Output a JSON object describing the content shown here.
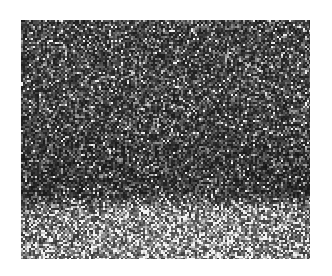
{
  "image": {
    "kind": "speckle-noise-texture",
    "colormap": "grayscale",
    "background_color": "#ffffff",
    "region": {
      "left": 21,
      "top": 20,
      "width": 289,
      "height": 239
    },
    "gradient": {
      "description": "darker upper portion with a dark band near y~70% of height; lighter, higher-contrast speckle at the bottom",
      "stops": [
        {
          "pos": 0.0,
          "mean": 0.3
        },
        {
          "pos": 0.35,
          "mean": 0.3
        },
        {
          "pos": 0.62,
          "mean": 0.24
        },
        {
          "pos": 0.72,
          "mean": 0.22
        },
        {
          "pos": 0.82,
          "mean": 0.52
        },
        {
          "pos": 1.0,
          "mean": 0.55
        }
      ],
      "bright_spot": {
        "x": 0.55,
        "y": 0.88,
        "strength": 0.12
      }
    },
    "speckle_grain_px": 2
  }
}
